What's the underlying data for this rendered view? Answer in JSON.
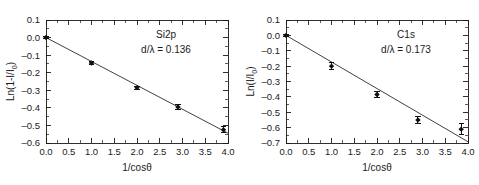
{
  "chart_data": [
    {
      "type": "scatter",
      "panel": "left",
      "title": "",
      "annotation_series": "Si2p",
      "annotation_value": "d/λ = 0.136",
      "xlabel": "1/cosθ",
      "ylabel": "Ln(1-I/I",
      "ylabel_sub": "0",
      "ylabel_tail": ")",
      "xlim": [
        0.0,
        4.0
      ],
      "ylim": [
        -0.6,
        0.1
      ],
      "grid": false,
      "legend": "none",
      "xticks": [
        "0.0",
        "0.5",
        "1.0",
        "1.5",
        "2.0",
        "2.5",
        "3.0",
        "3.5",
        "4.0"
      ],
      "xtick_values": [
        0.0,
        0.5,
        1.0,
        1.5,
        2.0,
        2.5,
        3.0,
        3.5,
        4.0
      ],
      "yticks": [
        "0.1",
        "0.0",
        "–0.1",
        "–0.2",
        "–0.3",
        "–0.4",
        "–0.5",
        "–0.6"
      ],
      "ytick_values": [
        0.1,
        0.0,
        -0.1,
        -0.2,
        -0.3,
        -0.4,
        -0.5,
        -0.6
      ],
      "x": [
        0.0,
        1.0,
        2.0,
        2.9,
        3.9
      ],
      "values": [
        0.0,
        -0.145,
        -0.285,
        -0.395,
        -0.525
      ],
      "yerr": [
        0.008,
        0.008,
        0.009,
        0.012,
        0.018
      ],
      "fit": {
        "slope": -0.136,
        "intercept": 0.0,
        "x_start": 0.0,
        "x_end": 4.0
      }
    },
    {
      "type": "scatter",
      "panel": "right",
      "title": "",
      "annotation_series": "C1s",
      "annotation_value": "d/λ = 0.173",
      "xlabel": "1/cosθ",
      "ylabel": "Ln(I/I",
      "ylabel_sub": "0",
      "ylabel_tail": ")",
      "xlim": [
        0.0,
        4.0
      ],
      "ylim": [
        -0.7,
        0.1
      ],
      "grid": false,
      "legend": "none",
      "xticks": [
        "0.0",
        "0.5",
        "1.0",
        "1.5",
        "2.0",
        "2.5",
        "3.0",
        "3.5",
        "4.0"
      ],
      "xtick_values": [
        0.0,
        0.5,
        1.0,
        1.5,
        2.0,
        2.5,
        3.0,
        3.5,
        4.0
      ],
      "yticks": [
        "0.1",
        "0.0",
        "–0.1",
        "–0.2",
        "–0.3",
        "–0.4",
        "–0.5",
        "–0.6",
        "–0.7"
      ],
      "ytick_values": [
        0.1,
        0.0,
        -0.1,
        -0.2,
        -0.3,
        -0.4,
        -0.5,
        -0.6,
        -0.7
      ],
      "x": [
        0.0,
        1.0,
        2.0,
        2.9,
        3.85
      ],
      "values": [
        0.0,
        -0.2,
        -0.385,
        -0.55,
        -0.61
      ],
      "yerr": [
        0.008,
        0.022,
        0.022,
        0.024,
        0.036
      ],
      "fit": {
        "slope": -0.173,
        "intercept": 0.0,
        "x_start": 0.0,
        "x_end": 4.0
      }
    }
  ]
}
